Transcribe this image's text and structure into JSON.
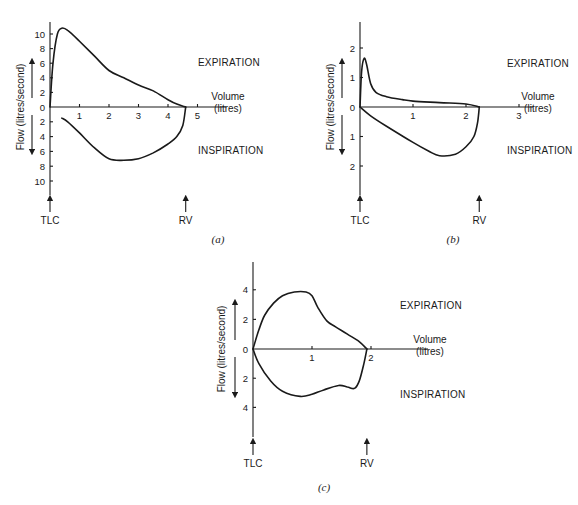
{
  "chart_data": [
    {
      "type": "line",
      "id": "a",
      "caption": "(a)",
      "xlabel": "Volume",
      "xlabel_unit": "(litres)",
      "ylabel": "Flow (litres/second)",
      "x_ticks": [
        1,
        2,
        3,
        4,
        5
      ],
      "y_ticks_expiration": [
        2,
        4,
        6,
        8,
        10
      ],
      "y_ticks_inspiration": [
        2,
        4,
        6,
        8,
        10
      ],
      "y_zero_label": "0",
      "xlim": [
        0,
        6
      ],
      "ylim": [
        -12,
        12
      ],
      "annotations": {
        "expiration": "EXPIRATION",
        "inspiration": "INSPIRATION",
        "tlc": "TLC",
        "rv": "RV",
        "rv_volume": 4.6
      },
      "series": [
        {
          "name": "Expiration",
          "x": [
            0,
            0.1,
            0.25,
            0.4,
            0.6,
            1.0,
            1.5,
            2.0,
            2.5,
            3.0,
            3.5,
            4.0,
            4.3,
            4.6
          ],
          "y": [
            0,
            6,
            10,
            10.8,
            10.5,
            9,
            7,
            5,
            4,
            3,
            2.2,
            1,
            0.4,
            0
          ]
        },
        {
          "name": "Inspiration",
          "x": [
            0.4,
            0.6,
            1.0,
            1.5,
            2.0,
            2.5,
            3.0,
            3.5,
            4.0,
            4.3,
            4.5,
            4.6
          ],
          "y": [
            -1.5,
            -2,
            -3.5,
            -5.5,
            -7,
            -7.2,
            -7,
            -6.2,
            -5,
            -4,
            -2.5,
            0
          ]
        }
      ]
    },
    {
      "type": "line",
      "id": "b",
      "caption": "(b)",
      "xlabel": "Volume",
      "xlabel_unit": "(litres)",
      "ylabel": "Flow (litres/second)",
      "x_ticks": [
        1,
        2,
        3
      ],
      "y_ticks_expiration": [
        1,
        2
      ],
      "y_ticks_inspiration": [
        1,
        2
      ],
      "y_zero_label": "0",
      "xlim": [
        0,
        3.3
      ],
      "ylim": [
        -3,
        3
      ],
      "annotations": {
        "expiration": "EXPIRATION",
        "inspiration": "INSPIRATION",
        "tlc": "TLC",
        "rv": "RV",
        "rv_volume": 2.25
      },
      "series": [
        {
          "name": "Expiration",
          "x": [
            0,
            0.03,
            0.08,
            0.13,
            0.2,
            0.3,
            0.5,
            0.8,
            1.0,
            1.5,
            2.0,
            2.25
          ],
          "y": [
            0,
            1.2,
            1.65,
            1.4,
            0.8,
            0.5,
            0.35,
            0.25,
            0.2,
            0.15,
            0.1,
            0
          ]
        },
        {
          "name": "Inspiration",
          "x": [
            0,
            0.2,
            0.5,
            1.0,
            1.3,
            1.5,
            1.8,
            2.0,
            2.15,
            2.22,
            2.25
          ],
          "y": [
            0,
            -0.3,
            -0.65,
            -1.2,
            -1.5,
            -1.65,
            -1.6,
            -1.35,
            -1.0,
            -0.5,
            0
          ]
        }
      ]
    },
    {
      "type": "line",
      "id": "c",
      "caption": "(c)",
      "xlabel": "Volume",
      "xlabel_unit": "(litres)",
      "ylabel": "Flow (litres/second)",
      "x_ticks": [
        1,
        2
      ],
      "y_ticks_expiration": [
        2,
        4
      ],
      "y_ticks_inspiration": [
        2,
        4
      ],
      "y_zero_label": "0",
      "xlim": [
        0,
        3
      ],
      "ylim": [
        -6,
        6
      ],
      "annotations": {
        "expiration": "EXPIRATION",
        "inspiration": "INSPIRATION",
        "tlc": "TLC",
        "rv": "RV",
        "rv_volume": 1.93
      },
      "series": [
        {
          "name": "Expiration",
          "x": [
            0,
            0.1,
            0.2,
            0.35,
            0.5,
            0.7,
            0.9,
            1.0,
            1.1,
            1.25,
            1.4,
            1.6,
            1.8,
            1.93
          ],
          "y": [
            0,
            1.3,
            2.3,
            3.1,
            3.6,
            3.85,
            3.85,
            3.6,
            2.8,
            1.9,
            1.5,
            1.0,
            0.5,
            0
          ]
        },
        {
          "name": "Inspiration",
          "x": [
            0,
            0.1,
            0.3,
            0.5,
            0.8,
            1.0,
            1.2,
            1.45,
            1.6,
            1.72,
            1.8,
            1.88,
            1.93
          ],
          "y": [
            0,
            -1.0,
            -2.2,
            -2.9,
            -3.25,
            -3.1,
            -2.8,
            -2.5,
            -2.6,
            -2.7,
            -2.2,
            -1.0,
            0
          ]
        }
      ]
    }
  ]
}
